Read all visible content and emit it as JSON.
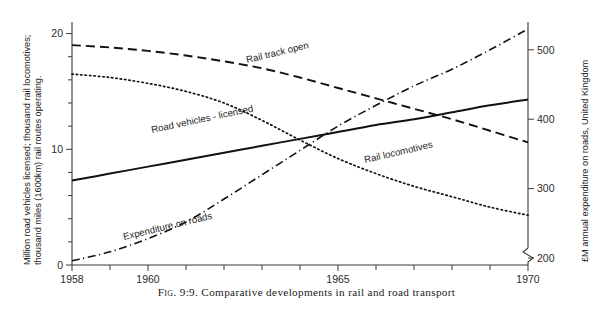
{
  "figure": {
    "caption_prefix": "Fig. 9:9.",
    "caption_text": "Comparative developments in rail and road transport"
  },
  "chart_data": {
    "type": "line",
    "title": "Comparative developments in rail and road transport",
    "xlabel": "",
    "ylabel": "Million road vehicles licensed; thousand rail locomotives; thousand miles (1600km) rail routes operating.",
    "y2label": "£M annual expenditure on roads, United Kingdom",
    "xlim": [
      1958,
      1970
    ],
    "ylim": [
      0,
      21
    ],
    "y2lim": [
      190,
      540
    ],
    "grid": false,
    "legend": "inline-labels",
    "x_ticks": [
      1958,
      1959,
      1960,
      1961,
      1962,
      1963,
      1964,
      1965,
      1966,
      1967,
      1968,
      1969,
      1970
    ],
    "x_tick_labels": [
      "1958",
      "",
      "1960",
      "",
      "",
      "",
      "",
      "1965",
      "",
      "",
      "",
      "",
      "1970"
    ],
    "y_ticks": [
      0,
      2,
      4,
      6,
      8,
      10,
      12,
      14,
      16,
      18,
      20
    ],
    "y_tick_labels": [
      "0",
      "",
      "",
      "",
      "",
      "10",
      "",
      "",
      "",
      "",
      "20"
    ],
    "y2_ticks": [
      200,
      300,
      400,
      500
    ],
    "y2_tick_labels": [
      "200",
      "300",
      "400",
      "500"
    ],
    "y2_axis_break": true,
    "x": [
      1958,
      1959,
      1960,
      1961,
      1962,
      1963,
      1964,
      1965,
      1966,
      1967,
      1968,
      1969,
      1970
    ],
    "series": [
      {
        "name": "Rail track open",
        "label": "Rail track open",
        "style": "dashed",
        "axis": "left",
        "values": [
          19.0,
          18.8,
          18.5,
          18.1,
          17.6,
          17.0,
          16.2,
          15.3,
          14.4,
          13.5,
          12.6,
          11.6,
          10.6
        ]
      },
      {
        "name": "Rail locomotives",
        "label": "Rail locomotives",
        "style": "dotted",
        "axis": "left",
        "values": [
          16.5,
          16.2,
          15.7,
          15.0,
          14.0,
          12.5,
          10.8,
          9.2,
          7.9,
          6.8,
          5.9,
          5.0,
          4.3
        ]
      },
      {
        "name": "Road vehicles - licensed",
        "label": "Road vehicles - licensed",
        "style": "solid",
        "axis": "left",
        "values": [
          7.3,
          7.9,
          8.5,
          9.1,
          9.7,
          10.3,
          10.9,
          11.5,
          12.1,
          12.6,
          13.2,
          13.8,
          14.3
        ]
      },
      {
        "name": "Expenditure on roads",
        "label": "Expenditure on roads",
        "style": "dash-dot",
        "axis": "right",
        "values": [
          196,
          209,
          228,
          252,
          285,
          320,
          355,
          390,
          420,
          448,
          472,
          500,
          530
        ]
      }
    ]
  },
  "axes": {
    "left_title": "Million road vehicles licensed; thousand rail locomotives; thousand miles (1600km) rail routes operating.",
    "right_title": "£M annual expenditure on roads, United Kingdom"
  }
}
